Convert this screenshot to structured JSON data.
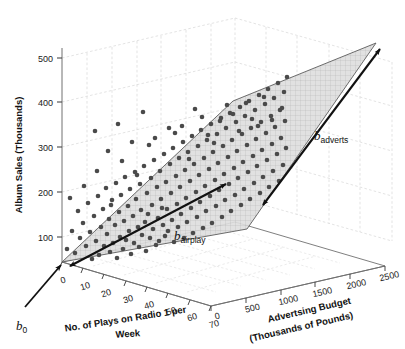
{
  "chart_data": {
    "type": "scatter",
    "title": "",
    "subtitle": "",
    "projection": "3d",
    "grid": true,
    "legend_position": "none",
    "xlabel": "No. of Plays on Radio 1 per Week",
    "ylabel": "Album Sales (Thousands)",
    "zlabel": "Advertsing Budget (Thousands of Pounds)",
    "xlabel_line1": "No. of Plays on Radio 1 per",
    "xlabel_line2": "Week",
    "zlabel_line1": "Advertsing Budget",
    "zlabel_line2": "(Thousands of Pounds)",
    "xticks": [
      0,
      10,
      20,
      30,
      40,
      50,
      60,
      70
    ],
    "yticks": [
      100,
      200,
      300,
      400,
      500
    ],
    "zticks": [
      0,
      500,
      1000,
      1500,
      2000,
      2500
    ],
    "xlim": [
      0,
      70
    ],
    "ylim": [
      0,
      550
    ],
    "zlim": [
      0,
      2500
    ],
    "annotations": [
      {
        "id": "b0",
        "text": "b",
        "sub": "0",
        "meaning": "intercept-at-origin"
      },
      {
        "id": "badverts",
        "text": "b",
        "sub": "adverts",
        "meaning": "slope-along-advertising-axis"
      },
      {
        "id": "bairplay",
        "text": "b",
        "sub": "airplay",
        "meaning": "slope-along-airplay-axis"
      }
    ],
    "series": [
      {
        "name": "Albums",
        "marker": "circle",
        "color": "#4a4a4a",
        "n_points": 200,
        "points_px": [
          [
            67,
            249
          ],
          [
            72,
            231
          ],
          [
            75,
            253
          ],
          [
            78,
            211
          ],
          [
            80,
            238
          ],
          [
            83,
            223
          ],
          [
            86,
            246
          ],
          [
            88,
            203
          ],
          [
            90,
            232
          ],
          [
            92,
            259
          ],
          [
            94,
            216
          ],
          [
            96,
            241
          ],
          [
            98,
            196
          ],
          [
            99,
            255
          ],
          [
            101,
            227
          ],
          [
            103,
            209
          ],
          [
            104,
            246
          ],
          [
            106,
            188
          ],
          [
            107,
            234
          ],
          [
            109,
            219
          ],
          [
            110,
            252
          ],
          [
            112,
            200
          ],
          [
            113,
            243
          ],
          [
            115,
            225
          ],
          [
            116,
            183
          ],
          [
            117,
            258
          ],
          [
            119,
            212
          ],
          [
            120,
            237
          ],
          [
            121,
            195
          ],
          [
            123,
            249
          ],
          [
            124,
            221
          ],
          [
            125,
            177
          ],
          [
            126,
            240
          ],
          [
            128,
            206
          ],
          [
            129,
            231
          ],
          [
            130,
            189
          ],
          [
            131,
            254
          ],
          [
            133,
            216
          ],
          [
            134,
            243
          ],
          [
            135,
            172
          ],
          [
            136,
            199
          ],
          [
            138,
            227
          ],
          [
            139,
            247
          ],
          [
            140,
            184
          ],
          [
            141,
            210
          ],
          [
            142,
            235
          ],
          [
            144,
            166
          ],
          [
            145,
            222
          ],
          [
            146,
            251
          ],
          [
            147,
            193
          ],
          [
            148,
            214
          ],
          [
            150,
            238
          ],
          [
            151,
            178
          ],
          [
            152,
            205
          ],
          [
            153,
            229
          ],
          [
            154,
            160
          ],
          [
            156,
            245
          ],
          [
            157,
            187
          ],
          [
            158,
            218
          ],
          [
            159,
            241
          ],
          [
            160,
            171
          ],
          [
            161,
            199
          ],
          [
            163,
            225
          ],
          [
            164,
            154
          ],
          [
            165,
            236
          ],
          [
            166,
            182
          ],
          [
            167,
            209
          ],
          [
            168,
            231
          ],
          [
            170,
            164
          ],
          [
            171,
            193
          ],
          [
            172,
            220
          ],
          [
            173,
            148
          ],
          [
            174,
            242
          ],
          [
            176,
            176
          ],
          [
            177,
            204
          ],
          [
            178,
            227
          ],
          [
            179,
            158
          ],
          [
            180,
            187
          ],
          [
            181,
            214
          ],
          [
            183,
            142
          ],
          [
            184,
            238
          ],
          [
            185,
            170
          ],
          [
            186,
            198
          ],
          [
            187,
            222
          ],
          [
            188,
            152
          ],
          [
            190,
            181
          ],
          [
            191,
            208
          ],
          [
            192,
            136
          ],
          [
            193,
            233
          ],
          [
            194,
            164
          ],
          [
            196,
            192
          ],
          [
            197,
            217
          ],
          [
            198,
            146
          ],
          [
            199,
            175
          ],
          [
            200,
            202
          ],
          [
            201,
            130
          ],
          [
            203,
            228
          ],
          [
            204,
            158
          ],
          [
            205,
            186
          ],
          [
            206,
            211
          ],
          [
            207,
            140
          ],
          [
            209,
            169
          ],
          [
            210,
            196
          ],
          [
            211,
            124
          ],
          [
            212,
            223
          ],
          [
            213,
            152
          ],
          [
            215,
            180
          ],
          [
            216,
            206
          ],
          [
            217,
            134
          ],
          [
            218,
            163
          ],
          [
            219,
            190
          ],
          [
            221,
            118
          ],
          [
            222,
            217
          ],
          [
            223,
            146
          ],
          [
            224,
            174
          ],
          [
            225,
            200
          ],
          [
            226,
            128
          ],
          [
            228,
            157
          ],
          [
            229,
            184
          ],
          [
            230,
            113
          ],
          [
            231,
            211
          ],
          [
            232,
            140
          ],
          [
            234,
            168
          ],
          [
            235,
            195
          ],
          [
            236,
            122
          ],
          [
            237,
            151
          ],
          [
            238,
            178
          ],
          [
            240,
            107
          ],
          [
            241,
            205
          ],
          [
            242,
            134
          ],
          [
            243,
            162
          ],
          [
            244,
            189
          ],
          [
            245,
            116
          ],
          [
            247,
            145
          ],
          [
            248,
            172
          ],
          [
            249,
            101
          ],
          [
            250,
            199
          ],
          [
            251,
            128
          ],
          [
            253,
            156
          ],
          [
            254,
            183
          ],
          [
            255,
            110
          ],
          [
            256,
            139
          ],
          [
            257,
            166
          ],
          [
            259,
            95
          ],
          [
            260,
            193
          ],
          [
            261,
            122
          ],
          [
            262,
            150
          ],
          [
            263,
            177
          ],
          [
            265,
            104
          ],
          [
            266,
            133
          ],
          [
            267,
            160
          ],
          [
            268,
            89
          ],
          [
            269,
            187
          ],
          [
            271,
            116
          ],
          [
            272,
            144
          ],
          [
            273,
            171
          ],
          [
            274,
            98
          ],
          [
            275,
            127
          ],
          [
            277,
            154
          ],
          [
            278,
            83
          ],
          [
            279,
            181
          ],
          [
            280,
            110
          ],
          [
            281,
            138
          ],
          [
            283,
            165
          ],
          [
            284,
            92
          ],
          [
            285,
            121
          ],
          [
            286,
            148
          ],
          [
            287,
            77
          ],
          [
            70,
            198
          ],
          [
            84,
            186
          ],
          [
            97,
            171
          ],
          [
            111,
            205
          ],
          [
            122,
            161
          ],
          [
            137,
            175
          ],
          [
            149,
            145
          ],
          [
            162,
            208
          ],
          [
            175,
            133
          ],
          [
            189,
            159
          ],
          [
            202,
            117
          ],
          [
            214,
            143
          ],
          [
            227,
            105
          ],
          [
            239,
            131
          ],
          [
            252,
            119
          ],
          [
            264,
            97
          ],
          [
            95,
            131
          ],
          [
            118,
            124
          ],
          [
            143,
            112
          ],
          [
            169,
            128
          ],
          [
            195,
            109
          ],
          [
            220,
            121
          ],
          [
            246,
            103
          ],
          [
            272,
            120
          ],
          [
            108,
            151
          ],
          [
            132,
            142
          ],
          [
            155,
            138
          ],
          [
            182,
            126
          ],
          [
            208,
            135
          ],
          [
            233,
            114
          ],
          [
            258,
            126
          ],
          [
            282,
            108
          ]
        ],
        "marker_size_px": 4.6
      }
    ],
    "plane": {
      "description": "regression plane with crosshatch texture",
      "fill": "#d9d9d9",
      "fill_opacity": 0.55,
      "edge_color": "#555555",
      "hatch": "crosshatch"
    },
    "colors": {
      "point": "#4a4a4a",
      "axis": "#3a3a3a",
      "grid": "#d8d8d8",
      "text": "#111111",
      "plane_fill": "#dcdcdc",
      "plane_edge": "#4f4f4f",
      "arrow": "#111111"
    }
  }
}
